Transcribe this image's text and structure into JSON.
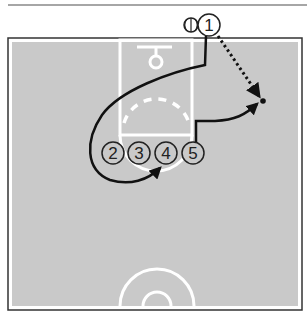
{
  "diagram": {
    "type": "basketball-play",
    "colors": {
      "court": "#c9c9c9",
      "court_lines": "#ffffff",
      "border": "#333333",
      "player_fill": "#ffffff",
      "player_stroke": "#222222",
      "path": "#111111",
      "top_rule": "#888888"
    },
    "players": [
      {
        "label": "1",
        "x": 209,
        "y": 25,
        "has_ball": true
      },
      {
        "label": "2",
        "x": 113,
        "y": 153
      },
      {
        "label": "3",
        "x": 139,
        "y": 153
      },
      {
        "label": "4",
        "x": 166,
        "y": 153
      },
      {
        "label": "5",
        "x": 193,
        "y": 153
      }
    ],
    "ball_icon": "basketball-icon",
    "pass": {
      "from": "1",
      "to_point": [
        263,
        101
      ],
      "style": "dotted"
    },
    "cuts": [
      {
        "player": "1",
        "style": "solid",
        "description": "down lane then loops around left to low block"
      },
      {
        "player": "5",
        "style": "solid",
        "description": "up and out to right wing"
      }
    ],
    "screen_path": {
      "style": "dashed-white",
      "description": "arc in key"
    }
  }
}
